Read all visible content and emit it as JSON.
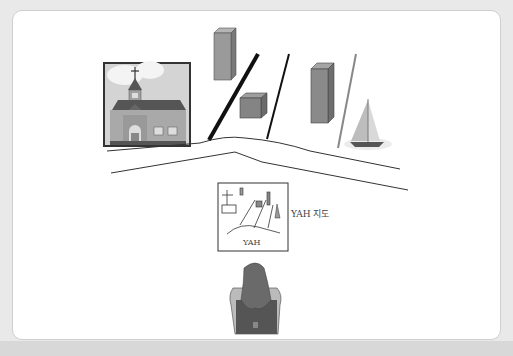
{
  "diagram": {
    "caption": "YAH 지도",
    "map_label": "YAH",
    "elements": [
      {
        "name": "church-picture",
        "type": "image"
      },
      {
        "name": "tall-building-left",
        "type": "building"
      },
      {
        "name": "cube-building",
        "type": "building"
      },
      {
        "name": "tall-building-right",
        "type": "building"
      },
      {
        "name": "sailboat",
        "type": "boat"
      },
      {
        "name": "road",
        "type": "road"
      },
      {
        "name": "street-lines",
        "count": 3
      },
      {
        "name": "you-are-here-map",
        "type": "map"
      },
      {
        "name": "person-back-view",
        "type": "figure"
      }
    ]
  },
  "colors": {
    "background": "#e9e9e9",
    "panel": "#ffffff",
    "building": "#8f8f8f",
    "line": "#222222"
  }
}
